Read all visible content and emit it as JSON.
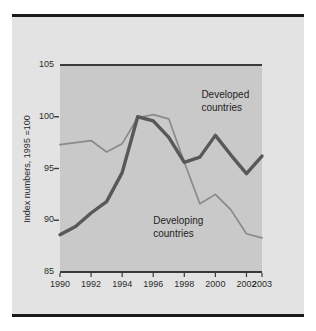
{
  "figure": {
    "panel_background": "#e3e3e3",
    "plot_background": "#c9c9c9",
    "rule_color": "#1a1a1a"
  },
  "chart_data": {
    "type": "line",
    "title": "",
    "subtitle": "",
    "xlabel": "",
    "ylabel": "Index numbers, 1995 =100",
    "xlim": [
      1990,
      2003
    ],
    "ylim": [
      85,
      105
    ],
    "yticks": [
      85,
      90,
      95,
      100,
      105
    ],
    "xticks": [
      1990,
      1992,
      1994,
      1996,
      1998,
      2000,
      2002,
      2003
    ],
    "xtick_labels": [
      "1990",
      "1992",
      "1994",
      "1996",
      "1998",
      "2000",
      "2002",
      "2003"
    ],
    "ytick_labels": [
      "85",
      "90",
      "95",
      "100",
      "105"
    ],
    "grid": false,
    "legend": "inline-annotations",
    "x": [
      1990,
      1991,
      1992,
      1993,
      1994,
      1995,
      1996,
      1997,
      1998,
      1999,
      2000,
      2001,
      2002,
      2003
    ],
    "series": [
      {
        "name": "Developed countries",
        "color": "#585858",
        "width": 3.4,
        "values": [
          88.6,
          89.4,
          90.7,
          91.8,
          94.6,
          100.0,
          99.6,
          98.0,
          95.6,
          96.1,
          98.2,
          96.3,
          94.5,
          96.2
        ],
        "label_x": 1999.1,
        "label_y": 102.1
      },
      {
        "name": "Developing countries",
        "color": "#8a8a8a",
        "width": 1.7,
        "values": [
          97.3,
          97.5,
          97.7,
          96.6,
          97.4,
          99.9,
          100.2,
          99.8,
          95.6,
          91.6,
          92.5,
          91.0,
          88.7,
          88.3
        ],
        "label_x": 1996.0,
        "label_y": 89.9
      }
    ],
    "annotations": [
      {
        "text_line1": "Developed",
        "text_line2": "countries"
      },
      {
        "text_line1": "Developing",
        "text_line2": "countries"
      }
    ]
  },
  "labels": {
    "y_axis_title": "Index numbers, 1995 =100",
    "developed_line1": "Developed",
    "developed_line2": "countries",
    "developing_line1": "Developing",
    "developing_line2": "countries"
  }
}
